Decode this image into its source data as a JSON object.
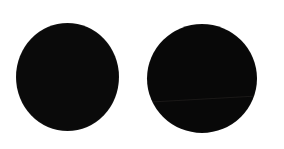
{
  "canvas": {
    "background_color": "#ffffff",
    "width": 284,
    "height": 149,
    "alt_text": "Two solid black circles on a white background"
  },
  "shapes": [
    {
      "id": "disc-left",
      "name": "black-circle-left",
      "type": "circle",
      "fill_color": "#0a0a0a",
      "center_x": 67,
      "center_y": 77,
      "diameter": 103,
      "label": ""
    },
    {
      "id": "disc-right",
      "name": "black-circle-right",
      "type": "circle",
      "fill_color": "#080808",
      "center_x": 202,
      "center_y": 78,
      "diameter": 110,
      "label": "",
      "seam": {
        "name": "faint-diagonal-seam",
        "color": "#2a2624",
        "angle_deg": -3.2
      }
    }
  ]
}
